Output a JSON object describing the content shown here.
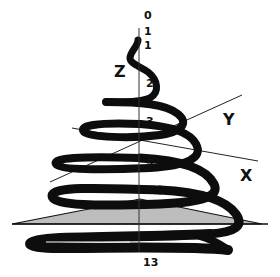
{
  "diagram": {
    "axes": {
      "z_label": "Z",
      "y_label": "Y",
      "x_label": "X"
    },
    "z_ticks": [
      {
        "label": "0",
        "x": 132,
        "y": 10
      },
      {
        "label": "1",
        "x": 132,
        "y": 24
      },
      {
        "label": "1",
        "x": 132,
        "y": 40
      },
      {
        "label": "2",
        "x": 146,
        "y": 79
      },
      {
        "label": "3",
        "x": 146,
        "y": 116
      },
      {
        "label": "5",
        "x": 146,
        "y": 160
      },
      {
        "label": "13",
        "x": 144,
        "y": 256
      }
    ],
    "colors": {
      "spiral": "#0d0d0d",
      "axis_line": "#222222",
      "base_fill": "#bdbdbd",
      "background": "#ffffff"
    }
  }
}
